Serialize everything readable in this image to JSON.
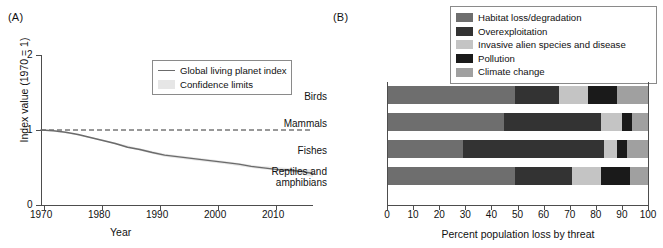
{
  "figure": {
    "panel_a_label": "(A)",
    "panel_b_label": "(B)"
  },
  "chart_data": [
    {
      "type": "line",
      "panel": "(A)",
      "title": "",
      "xlabel": "Year",
      "ylabel": "Index value (1970 = 1)",
      "xlim": [
        1970,
        2014
      ],
      "ylim": [
        0,
        2
      ],
      "xticks": [
        1970,
        1980,
        1990,
        2000,
        2010
      ],
      "yticks": [
        0,
        1,
        2
      ],
      "grid": false,
      "legend_position": "top-right-inside",
      "legend": [
        {
          "label": "Global living planet index",
          "marker": "line",
          "color": "#6b6b6b"
        },
        {
          "label": "Confidence limits",
          "marker": "band",
          "color": "#e2e2e2"
        }
      ],
      "reference_line": {
        "value": 1,
        "style": "dashed",
        "color": "#333333"
      },
      "series": [
        {
          "name": "Global living planet index",
          "x": [
            1970,
            1972,
            1974,
            1976,
            1978,
            1980,
            1982,
            1984,
            1986,
            1988,
            1990,
            1992,
            1994,
            1996,
            1998,
            2000,
            2002,
            2004,
            2006,
            2008,
            2010,
            2012,
            2014
          ],
          "values": [
            1.0,
            0.99,
            0.97,
            0.94,
            0.9,
            0.86,
            0.82,
            0.77,
            0.74,
            0.7,
            0.665,
            0.645,
            0.625,
            0.605,
            0.585,
            0.565,
            0.545,
            0.515,
            0.495,
            0.475,
            0.465,
            0.45,
            0.42
          ]
        },
        {
          "name": "Confidence upper",
          "x": [
            1970,
            1975,
            1980,
            1985,
            1990,
            1995,
            2000,
            2005,
            2010,
            2014
          ],
          "values": [
            1.0,
            0.955,
            0.875,
            0.775,
            0.685,
            0.635,
            0.585,
            0.525,
            0.495,
            0.475
          ]
        },
        {
          "name": "Confidence lower",
          "x": [
            1970,
            1975,
            1980,
            1985,
            1990,
            1995,
            2000,
            2005,
            2010,
            2014
          ],
          "values": [
            1.0,
            0.945,
            0.855,
            0.745,
            0.645,
            0.595,
            0.545,
            0.485,
            0.445,
            0.375
          ]
        }
      ]
    },
    {
      "type": "bar",
      "panel": "(B)",
      "orientation": "horizontal",
      "stacked": true,
      "title": "",
      "xlabel": "Percent population loss by threat",
      "ylabel": "",
      "xlim": [
        0,
        100
      ],
      "xticks": [
        0,
        10,
        20,
        30,
        40,
        50,
        60,
        70,
        80,
        90,
        100
      ],
      "grid": false,
      "legend_position": "top",
      "categories": [
        "Birds",
        "Mammals",
        "Fishes",
        "Reptiles and amphibians"
      ],
      "series": [
        {
          "name": "Habitat loss/degradation",
          "color": "#6e6e6e",
          "values": [
            49,
            45,
            29,
            49
          ]
        },
        {
          "name": "Overexploitation",
          "color": "#333333",
          "values": [
            17,
            37,
            54,
            22
          ]
        },
        {
          "name": "Invasive alien species and disease",
          "color": "#c4c4c4",
          "values": [
            11,
            8,
            5,
            11
          ]
        },
        {
          "name": "Pollution",
          "color": "#1a1a1a",
          "values": [
            11,
            4,
            4,
            11
          ]
        },
        {
          "name": "Climate change",
          "color": "#a0a0a0",
          "values": [
            12,
            6,
            8,
            7
          ]
        }
      ]
    }
  ]
}
